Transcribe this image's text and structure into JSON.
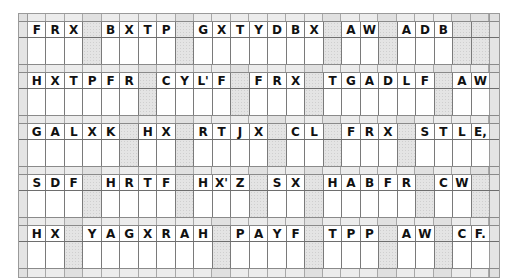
{
  "puzzle": {
    "type": "cryptogram",
    "columns": 25,
    "shade_color": "#e4e4e4",
    "rows": [
      {
        "cells": [
          "F",
          "R",
          "X",
          "",
          "B",
          "X",
          "T",
          "P",
          "",
          "G",
          "X",
          "T",
          "Y",
          "D",
          "B",
          "X",
          "",
          "A",
          "W",
          "",
          "A",
          "D",
          "B",
          "",
          ""
        ]
      },
      {
        "cells": [
          "H",
          "X",
          "T",
          "P",
          "F",
          "R",
          "",
          "C",
          "Y",
          "L'",
          "F",
          "",
          "F",
          "R",
          "X",
          "",
          "T",
          "G",
          "A",
          "D",
          "L",
          "F",
          "",
          "A",
          "W"
        ]
      },
      {
        "cells": [
          "G",
          "A",
          "L",
          "X",
          "K",
          "",
          "H",
          "X",
          "",
          "R",
          "T",
          "J",
          "X",
          "",
          "C",
          "L",
          "",
          "F",
          "R",
          "X",
          "",
          "S",
          "T",
          "L",
          "E,"
        ]
      },
      {
        "cells": [
          "S",
          "D",
          "F",
          "",
          "H",
          "R",
          "T",
          "F",
          "",
          "H",
          "X'",
          "Z",
          "",
          "S",
          "X",
          "",
          "H",
          "A",
          "B",
          "F",
          "R",
          "",
          "C",
          "W",
          ""
        ]
      },
      {
        "cells": [
          "H",
          "X",
          "",
          "Y",
          "A",
          "G",
          "X",
          "R",
          "A",
          "H",
          "",
          "P",
          "A",
          "Y",
          "F",
          "",
          "T",
          "P",
          "P",
          "",
          "A",
          "W",
          "",
          "C",
          "F."
        ]
      }
    ]
  }
}
